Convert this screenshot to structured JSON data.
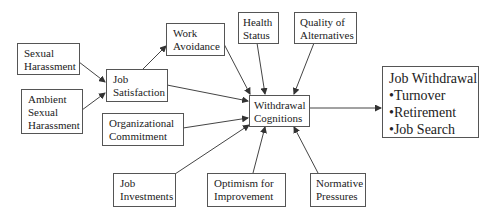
{
  "diagram": {
    "nodes": {
      "sexual_harassment": {
        "lines": [
          "Sexual",
          "Harassment"
        ]
      },
      "ambient_sexual_harassment": {
        "lines": [
          "Ambient",
          "Sexual",
          "Harassment"
        ]
      },
      "job_satisfaction": {
        "lines": [
          "Job",
          "Satisfaction"
        ]
      },
      "work_avoidance": {
        "lines": [
          "Work",
          "Avoidance"
        ]
      },
      "health_status": {
        "lines": [
          "Health",
          "Status"
        ]
      },
      "quality_of_alternatives": {
        "lines": [
          "Quality of",
          "Alternatives"
        ]
      },
      "organizational_commitment": {
        "lines": [
          "Organizational",
          "Commitment"
        ]
      },
      "withdrawal_cognitions": {
        "lines": [
          "Withdrawal",
          "Cognitions"
        ]
      },
      "job_withdrawal": {
        "lines": [
          "Job Withdrawal",
          "•Turnover",
          "•Retirement",
          "•Job Search"
        ]
      },
      "job_investments": {
        "lines": [
          "Job",
          "Investments"
        ]
      },
      "optimism_for_improvement": {
        "lines": [
          "Optimism for",
          "Improvement"
        ]
      },
      "normative_pressures": {
        "lines": [
          "Normative",
          "Pressures"
        ]
      }
    },
    "edges": [
      {
        "from": "Sexual Harassment",
        "to": "Job Satisfaction"
      },
      {
        "from": "Ambient Sexual Harassment",
        "to": "Job Satisfaction"
      },
      {
        "from": "Job Satisfaction",
        "to": "Work Avoidance"
      },
      {
        "from": "Job Satisfaction",
        "to": "Withdrawal Cognitions"
      },
      {
        "from": "Work Avoidance",
        "to": "Withdrawal Cognitions"
      },
      {
        "from": "Health Status",
        "to": "Withdrawal Cognitions"
      },
      {
        "from": "Quality of Alternatives",
        "to": "Withdrawal Cognitions"
      },
      {
        "from": "Organizational Commitment",
        "to": "Withdrawal Cognitions"
      },
      {
        "from": "Job Investments",
        "to": "Withdrawal Cognitions"
      },
      {
        "from": "Optimism for Improvement",
        "to": "Withdrawal Cognitions"
      },
      {
        "from": "Normative Pressures",
        "to": "Withdrawal Cognitions"
      },
      {
        "from": "Withdrawal Cognitions",
        "to": "Job Withdrawal"
      }
    ],
    "colors": {
      "line": "#444444",
      "border": "#555555",
      "text": "#222222"
    }
  }
}
